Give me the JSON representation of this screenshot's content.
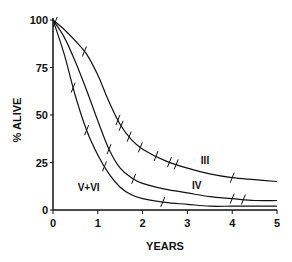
{
  "chart_data": {
    "type": "line",
    "title": "",
    "xlabel": "YEARS",
    "ylabel": "% ALIVE",
    "xlim": [
      0,
      5
    ],
    "ylim": [
      0,
      100
    ],
    "x_ticks": [
      "0",
      "1",
      "2",
      "3",
      "4",
      "5"
    ],
    "y_ticks": [
      "0",
      "25",
      "50",
      "75",
      "100"
    ],
    "grid": false,
    "legend": "inline curve labels",
    "series": [
      {
        "name": "III",
        "x": [
          0,
          0.25,
          0.5,
          0.75,
          1.0,
          1.25,
          1.5,
          1.75,
          2.0,
          2.5,
          3.0,
          3.5,
          4.0,
          4.5,
          5.0
        ],
        "values": [
          100,
          95,
          89,
          82,
          71,
          57,
          45,
          37,
          32,
          26,
          22,
          19,
          17,
          16,
          15
        ],
        "censor_ticks_x": [
          0.05,
          0.7,
          1.45,
          1.52,
          1.7,
          1.95,
          2.3,
          2.6,
          2.75,
          4.0
        ]
      },
      {
        "name": "IV",
        "x": [
          0,
          0.25,
          0.5,
          0.75,
          1.0,
          1.25,
          1.5,
          1.75,
          2.0,
          2.5,
          3.0,
          3.5,
          4.0,
          4.5,
          5.0
        ],
        "values": [
          100,
          91,
          78,
          63,
          47,
          32,
          22,
          17,
          14,
          11,
          9,
          7,
          6,
          5,
          5
        ],
        "censor_ticks_x": [
          1.25,
          1.8,
          4.0,
          4.25
        ]
      },
      {
        "name": "V+VI",
        "x": [
          0,
          0.25,
          0.5,
          0.75,
          1.0,
          1.25,
          1.5,
          1.75,
          2.0,
          2.5,
          3.0,
          3.5,
          4.0,
          4.5,
          5.0
        ],
        "values": [
          100,
          82,
          60,
          42,
          29,
          19,
          12,
          8,
          6,
          4,
          3,
          2,
          2,
          2,
          2
        ],
        "censor_ticks_x": [
          0.45,
          0.75,
          1.15,
          2.45
        ]
      }
    ],
    "annotations": [
      {
        "text": "III",
        "x": 3.3,
        "y": 24
      },
      {
        "text": "IV",
        "x": 3.1,
        "y": 11
      },
      {
        "text": "V+VI",
        "x": 0.55,
        "y": 10
      }
    ]
  }
}
